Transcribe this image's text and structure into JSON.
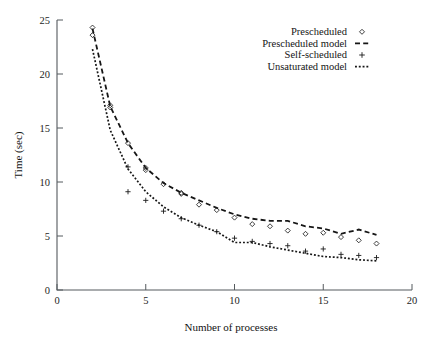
{
  "chart_data": {
    "type": "scatter",
    "title": "",
    "xlabel": "Number of processes",
    "ylabel": "Time (sec)",
    "xlim": [
      0,
      20
    ],
    "ylim": [
      0,
      25
    ],
    "xticks": [
      0,
      5,
      10,
      15,
      20
    ],
    "yticks": [
      0,
      5,
      10,
      15,
      20,
      25
    ],
    "grid": false,
    "legend_position": "top-right",
    "legend": [
      {
        "label": "Prescheduled",
        "marker": "diamond-marker",
        "style": "points"
      },
      {
        "label": "Prescheduled model",
        "marker": "dashed-line",
        "style": "dashed"
      },
      {
        "label": "Self-scheduled",
        "marker": "plus-marker",
        "style": "points"
      },
      {
        "label": "Unsaturated model",
        "marker": "dotted-line",
        "style": "dotted"
      }
    ],
    "series": [
      {
        "name": "Prescheduled",
        "style": "points",
        "marker": "diamond",
        "x": [
          2,
          2,
          3,
          3,
          4,
          5,
          5,
          6,
          7,
          7,
          8,
          9,
          10,
          11,
          12,
          13,
          14,
          15,
          16,
          17,
          18
        ],
        "y": [
          24.3,
          23.6,
          17.1,
          16.9,
          13.6,
          11.3,
          11.1,
          9.8,
          9.0,
          8.9,
          7.9,
          7.4,
          6.7,
          6.1,
          5.9,
          5.5,
          5.2,
          5.3,
          4.9,
          4.6,
          4.3
        ]
      },
      {
        "name": "Prescheduled model",
        "style": "dashed",
        "x": [
          2,
          3,
          4,
          5,
          6,
          7,
          8,
          9,
          10,
          11,
          12,
          13,
          14,
          15,
          16,
          17,
          18
        ],
        "y": [
          24.2,
          17.0,
          13.6,
          11.3,
          9.9,
          9.0,
          8.3,
          7.6,
          7.0,
          6.6,
          6.4,
          6.4,
          5.9,
          5.7,
          5.2,
          5.6,
          5.1
        ]
      },
      {
        "name": "Self-scheduled",
        "style": "points",
        "marker": "plus",
        "x": [
          4,
          4,
          5,
          6,
          7,
          8,
          9,
          10,
          11,
          12,
          13,
          14,
          15,
          16,
          17,
          18
        ],
        "y": [
          11.4,
          9.1,
          8.3,
          7.3,
          6.6,
          6.0,
          5.4,
          4.8,
          4.5,
          4.3,
          4.1,
          3.6,
          3.8,
          3.3,
          3.2,
          3.0
        ]
      },
      {
        "name": "Unsaturated model",
        "style": "dotted",
        "x": [
          2,
          3,
          4,
          5,
          6,
          7,
          8,
          9,
          10,
          11,
          12,
          13,
          14,
          15,
          16,
          17,
          18
        ],
        "y": [
          22.3,
          14.8,
          11.2,
          9.1,
          7.7,
          6.7,
          6.0,
          5.4,
          4.4,
          4.4,
          4.0,
          3.7,
          3.4,
          3.1,
          3.0,
          2.8,
          2.7
        ]
      }
    ]
  },
  "axes": {
    "xlabel": "Number of processes",
    "ylabel": "Time (sec)",
    "xticks": [
      "0",
      "5",
      "10",
      "15",
      "20"
    ],
    "yticks": [
      "0",
      "5",
      "10",
      "15",
      "20",
      "25"
    ]
  },
  "legend": {
    "items": [
      {
        "label": "Prescheduled"
      },
      {
        "label": "Prescheduled model"
      },
      {
        "label": "Self-scheduled"
      },
      {
        "label": "Unsaturated model"
      }
    ]
  }
}
